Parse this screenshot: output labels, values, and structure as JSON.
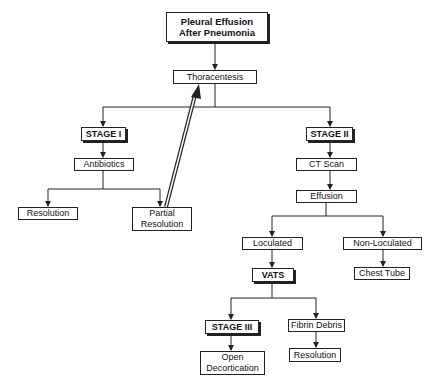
{
  "diagram": {
    "title": "Pleural Effusion After Pneumonia",
    "nodes": {
      "thoracentesis": "Thoracentesis",
      "stage1": "STAGE I",
      "antibiotics": "Antibiotics",
      "resolution1": "Resolution",
      "partial_resolution": "Partial Resolution",
      "stage2": "STAGE II",
      "ct_scan": "CT Scan",
      "effusion": "Effusion",
      "loculated": "Loculated",
      "non_loculated": "Non-Loculated",
      "vats": "VATS",
      "chest_tube": "Chest Tube",
      "stage3": "STAGE III",
      "fibrin_debris": "Fibrin Debris",
      "open_decortication": "Open Decortication",
      "resolution2": "Resolution"
    },
    "edges": [
      [
        "title",
        "thoracentesis"
      ],
      [
        "thoracentesis",
        "stage1"
      ],
      [
        "thoracentesis",
        "stage2"
      ],
      [
        "stage1",
        "antibiotics"
      ],
      [
        "antibiotics",
        "resolution1"
      ],
      [
        "antibiotics",
        "partial_resolution"
      ],
      [
        "partial_resolution",
        "thoracentesis"
      ],
      [
        "stage2",
        "ct_scan"
      ],
      [
        "ct_scan",
        "effusion"
      ],
      [
        "effusion",
        "loculated"
      ],
      [
        "effusion",
        "non_loculated"
      ],
      [
        "loculated",
        "vats"
      ],
      [
        "non_loculated",
        "chest_tube"
      ],
      [
        "vats",
        "stage3"
      ],
      [
        "vats",
        "fibrin_debris"
      ],
      [
        "stage3",
        "open_decortication"
      ],
      [
        "fibrin_debris",
        "resolution2"
      ]
    ],
    "colors": {
      "line": "#222222",
      "background": "#ffffff"
    }
  }
}
